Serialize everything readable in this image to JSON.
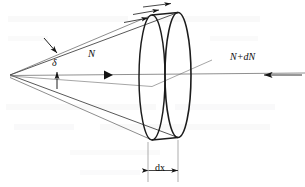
{
  "figure": {
    "background_color": "#ffffff",
    "line_color": "#1a1a1a",
    "thin_line_color": "#5a5a5a",
    "labels": {
      "delta": "δ",
      "flux_in": "N",
      "flux_out": "N+dN",
      "thickness": "dx"
    },
    "geometry": {
      "apex": [
        10,
        75
      ],
      "upper_edge_end": [
        172,
        14
      ],
      "lower_edge_end": [
        172,
        140
      ],
      "back_ellipse": {
        "cx": 152,
        "cy": 77,
        "rx": 13,
        "ry": 63
      },
      "front_ellipse": {
        "cx": 178,
        "cy": 74,
        "rx": 13,
        "ry": 63
      },
      "axis_y": 75,
      "axis_x_start": 10,
      "axis_x_end": 305,
      "flux_marker_x": 110,
      "dim_left_x": 148,
      "dim_right_x": 186,
      "dim_y": 170
    },
    "markers": {
      "surface_arrow_count": 3,
      "delta_pointer_count": 2,
      "flux_in_arrow": "right-triangle",
      "flux_out_arrow": "left-arrow",
      "dimension_arrows": "double-headed"
    }
  }
}
